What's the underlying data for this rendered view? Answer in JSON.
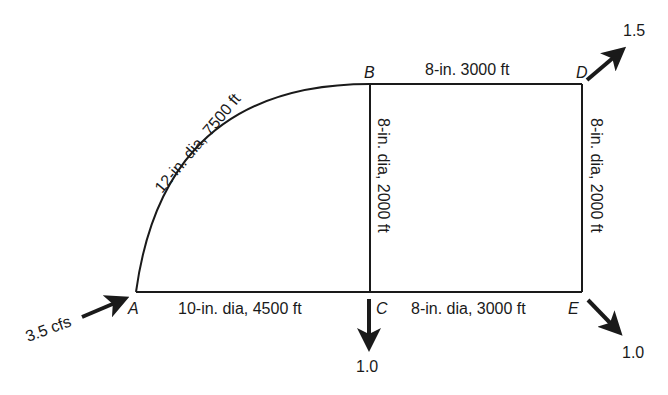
{
  "diagram": {
    "type": "pipe-network",
    "nodes": [
      {
        "id": "A",
        "label": "A"
      },
      {
        "id": "B",
        "label": "B"
      },
      {
        "id": "C",
        "label": "C"
      },
      {
        "id": "D",
        "label": "D"
      },
      {
        "id": "E",
        "label": "E"
      }
    ],
    "pipes": [
      {
        "from": "A",
        "to": "B",
        "label": "12-in. dia, 7500 ft"
      },
      {
        "from": "B",
        "to": "D",
        "label": "8-in. 3000 ft"
      },
      {
        "from": "B",
        "to": "C",
        "label": "8-in. dia, 2000 ft"
      },
      {
        "from": "D",
        "to": "E",
        "label": "8-in. dia, 2000 ft"
      },
      {
        "from": "A",
        "to": "C",
        "label": "10-in. dia, 4500 ft"
      },
      {
        "from": "C",
        "to": "E",
        "label": "8-in. dia, 3000 ft"
      }
    ],
    "flows": [
      {
        "node": "A",
        "direction": "inflow",
        "label": "3.5 cfs"
      },
      {
        "node": "D",
        "direction": "outflow",
        "label": "1.5"
      },
      {
        "node": "C",
        "direction": "outflow",
        "label": "1.0"
      },
      {
        "node": "E",
        "direction": "outflow",
        "label": "1.0"
      }
    ]
  }
}
